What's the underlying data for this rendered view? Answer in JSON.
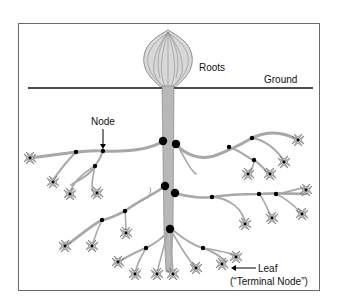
{
  "diagram": {
    "type": "tree-structure-analogy",
    "labels": {
      "roots": "Roots",
      "ground": "Ground",
      "node": "Node",
      "leaf": "Leaf",
      "terminal_node": "(“Terminal Node”)"
    },
    "colors": {
      "branch_fill": "#b8b8b8",
      "branch_stroke": "#7a7a7a",
      "node": "#000000",
      "ground_line": "#111111",
      "frame": "#6a6a6a",
      "leaf_fill": "#c8c8c8"
    },
    "node_count_visible": 29,
    "leaf_count_visible": 22
  }
}
